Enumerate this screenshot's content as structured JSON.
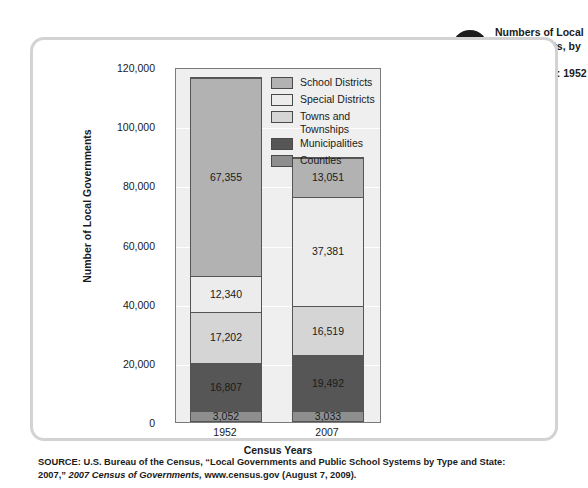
{
  "figure": {
    "badge_word": "FIGURE",
    "badge_number": "10.1",
    "title": "Numbers of Local Governments, by Type of Government: 1952 Versus 2007"
  },
  "legend": {
    "items": [
      {
        "label": "School Districts",
        "color": "#b2b2b2"
      },
      {
        "label": "Special Districts",
        "color": "#ececec"
      },
      {
        "label": "Towns and Townships",
        "color": "#d5d5d5"
      },
      {
        "label": "Municipalities",
        "color": "#565656"
      },
      {
        "label": "Counties",
        "color": "#8e8e8e"
      }
    ]
  },
  "axes": {
    "y_title": "Number of Local Governments",
    "x_title": "Census Years",
    "y_ticks": [
      "0",
      "20,000",
      "40,000",
      "60,000",
      "80,000",
      "100,000",
      "120,000"
    ],
    "x_ticks": [
      "1952",
      "2007"
    ]
  },
  "source": {
    "prefix": "SOURCE: U.S. Bureau of the Census, “Local Governments and Public School Systems by Type and State: 2007,” ",
    "italic": "2007 Census of Governments,",
    "suffix": " www.census.gov (August 7, 2009)."
  },
  "bars": {
    "b1952": {
      "label": "1952",
      "segments": [
        {
          "name": "Counties",
          "value": "3,052"
        },
        {
          "name": "Municipalities",
          "value": "16,807"
        },
        {
          "name": "Towns and Townships",
          "value": "17,202"
        },
        {
          "name": "Special Districts",
          "value": "12,340"
        },
        {
          "name": "School Districts",
          "value": "67,355"
        }
      ]
    },
    "b2007": {
      "label": "2007",
      "segments": [
        {
          "name": "Counties",
          "value": "3,033"
        },
        {
          "name": "Municipalities",
          "value": "19,492"
        },
        {
          "name": "Towns and Townships",
          "value": "16,519"
        },
        {
          "name": "Special Districts",
          "value": "37,381"
        },
        {
          "name": "School Districts",
          "value": "13,051"
        }
      ]
    }
  },
  "chart_data": {
    "type": "bar",
    "subtype": "stacked-vertical",
    "title": "Numbers of Local Governments, by Type of Government: 1952 Versus 2007",
    "xlabel": "Census Years",
    "ylabel": "Number of Local Governments",
    "categories": [
      "1952",
      "2007"
    ],
    "ylim": [
      0,
      120000
    ],
    "yticks": [
      0,
      20000,
      40000,
      60000,
      80000,
      100000,
      120000
    ],
    "grid": true,
    "legend_position": "inside-top-right",
    "stack_order_bottom_to_top": [
      "Counties",
      "Municipalities",
      "Towns and Townships",
      "Special Districts",
      "School Districts"
    ],
    "series": [
      {
        "name": "Counties",
        "color": "#8e8e8e",
        "values": [
          3052,
          3033
        ]
      },
      {
        "name": "Municipalities",
        "color": "#565656",
        "values": [
          16807,
          19492
        ]
      },
      {
        "name": "Towns and Townships",
        "color": "#d5d5d5",
        "values": [
          17202,
          16519
        ]
      },
      {
        "name": "Special Districts",
        "color": "#ececec",
        "values": [
          12340,
          37381
        ]
      },
      {
        "name": "School Districts",
        "color": "#b2b2b2",
        "values": [
          67355,
          13051
        ]
      }
    ],
    "totals": [
      116756,
      89476
    ],
    "data_labels": [
      [
        "3,052",
        "16,807",
        "17,202",
        "12,340",
        "67,355"
      ],
      [
        "3,033",
        "19,492",
        "16,519",
        "37,381",
        "13,051"
      ]
    ],
    "source": "SOURCE: U.S. Bureau of the Census, “Local Governments and Public School Systems by Type and State: 2007,” 2007 Census of Governments, www.census.gov (August 7, 2009)."
  }
}
